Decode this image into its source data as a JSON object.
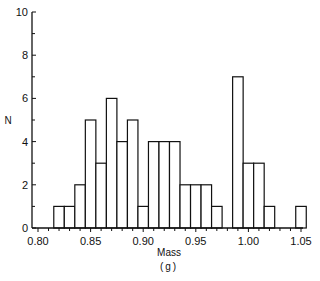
{
  "chart_data": {
    "type": "bar",
    "subtype": "histogram",
    "title": "",
    "xlabel": "Mass",
    "xunit": "(g)",
    "ylabel": "N",
    "xlim": [
      0.8,
      1.05
    ],
    "ylim": [
      0,
      10
    ],
    "x_ticks": [
      "0.80",
      "0.85",
      "0.90",
      "0.95",
      "1.00",
      "1.05"
    ],
    "y_ticks": [
      "0",
      "2",
      "4",
      "6",
      "8",
      "10"
    ],
    "grid": false,
    "legend": null,
    "bin_width": 0.01,
    "bin_left_edges": [
      0.815,
      0.825,
      0.835,
      0.845,
      0.855,
      0.865,
      0.875,
      0.885,
      0.895,
      0.905,
      0.915,
      0.925,
      0.935,
      0.945,
      0.955,
      0.965,
      0.975,
      0.985,
      0.995,
      1.005,
      1.015,
      1.025,
      1.035,
      1.045
    ],
    "values": [
      1,
      1,
      2,
      5,
      3,
      6,
      4,
      5,
      1,
      4,
      4,
      4,
      2,
      2,
      2,
      1,
      0,
      7,
      3,
      3,
      1,
      0,
      0,
      1
    ]
  }
}
